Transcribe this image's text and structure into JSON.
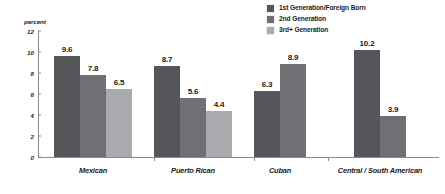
{
  "chart_data": {
    "type": "bar",
    "title": "",
    "subtitle": "",
    "xlabel": "",
    "ylabel": "percent",
    "ylim": [
      0,
      12
    ],
    "yticks": [
      "0",
      "2",
      "4",
      "6",
      "8",
      "10",
      "12"
    ],
    "grid": false,
    "legend_position": "top-right",
    "categories": [
      "Mexican",
      "Puerto Rican",
      "Cuban",
      "Central / South American"
    ],
    "series": [
      {
        "name": "1st Generation/Foreign Born",
        "color": "#55565a",
        "values": [
          9.6,
          8.7,
          6.3,
          10.2
        ],
        "labels": [
          "9.6",
          "8.7",
          "6.3",
          "10.2"
        ]
      },
      {
        "name": "2nd Generation",
        "color": "#6f7074",
        "values": [
          7.8,
          5.6,
          8.9,
          3.9
        ],
        "labels": [
          "7.8",
          "5.6",
          "8.9",
          "3.9"
        ]
      },
      {
        "name": "3rd+ Generation",
        "color": "#aaabae",
        "values": [
          6.5,
          4.4,
          null,
          null
        ],
        "labels": [
          "6.5",
          "4.4",
          "",
          ""
        ]
      }
    ]
  },
  "legend": {
    "items": [
      {
        "label": "1st Generation/Foreign Born",
        "color": "#55565a"
      },
      {
        "label": "2nd Generation",
        "color": "#6f7074"
      },
      {
        "label": "3rd+ Generation",
        "color": "#aaabae"
      }
    ]
  },
  "axis": {
    "y_title": "percent",
    "y_ticks": [
      "12",
      "10",
      "8",
      "6",
      "4",
      "2",
      "0"
    ]
  },
  "categories": [
    {
      "label": "Mexican"
    },
    {
      "label": "Puerto Rican"
    },
    {
      "label": "Cuban"
    },
    {
      "label": "Central / South American"
    }
  ]
}
